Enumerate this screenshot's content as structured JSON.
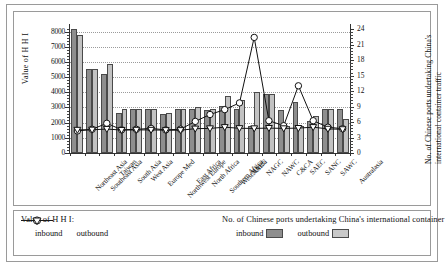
{
  "chart_data": {
    "type": "bar",
    "title": "",
    "ylabel": "Value of  H H I",
    "ylabel_right": "No. of Chinese ports undertaking China's international container traffic",
    "xlabel": "",
    "ylim": [
      0,
      8500
    ],
    "yticks": [
      0,
      1000,
      2000,
      3000,
      4000,
      5000,
      6000,
      7000,
      8000
    ],
    "ylim_right": [
      0,
      25
    ],
    "yticks_right": [
      0,
      3,
      6,
      9,
      12,
      15,
      18,
      21,
      24
    ],
    "grid": true,
    "legend_position": "bottom",
    "categories": [
      "Northeast Asia",
      "Southeast Asia",
      "Taiwan",
      "South Asia",
      "West Asia",
      "Europe Med",
      "Northwest Europe",
      "East Africa",
      "North Africa",
      "Southern Africa",
      "West Africa",
      "NAEC",
      "NAGC",
      "NAWC",
      "C&CA",
      "SAEC",
      "SANC",
      "SAWC",
      "Australasia"
    ],
    "series": [
      {
        "name": "inbound",
        "kind": "bar",
        "axis": "right",
        "values": [
          24.0,
          16.3,
          15.4,
          7.7,
          8.6,
          8.6,
          7.6,
          8.6,
          8.6,
          8.3,
          9.2,
          8.6,
          5.2,
          11.5,
          8.3,
          9.8,
          6.3,
          8.6,
          8.6
        ]
      },
      {
        "name": "outbound",
        "kind": "bar",
        "axis": "right",
        "values": [
          22.9,
          16.3,
          17.2,
          8.6,
          8.6,
          8.6,
          7.7,
          8.6,
          8.9,
          8.6,
          11.0,
          10.3,
          11.8,
          11.5,
          5.2,
          5.2,
          7.2,
          8.6,
          6.6
        ]
      },
      {
        "name": "inbound",
        "kind": "line",
        "axis": "left",
        "marker": "circle",
        "values": [
          1450,
          1560,
          1960,
          1530,
          1560,
          1620,
          1520,
          1570,
          2080,
          2540,
          2860,
          3300,
          7620,
          2130,
          1800,
          4430,
          2130,
          1700,
          1600
        ]
      },
      {
        "name": "outbound",
        "kind": "line",
        "axis": "left",
        "marker": "triangle-down",
        "values": [
          1520,
          1530,
          1580,
          1510,
          1520,
          1520,
          1500,
          1500,
          1600,
          1620,
          1700,
          1630,
          1620,
          1640,
          1620,
          1640,
          1700,
          1590,
          1560
        ]
      }
    ]
  },
  "legend": {
    "left_title": "Value of  H H I:",
    "left_inbound": "inbound",
    "left_outbound": "outbound",
    "right_title": "No. of Chinese ports undertaking China's international container traffic:",
    "right_inbound": "inbound",
    "right_outbound": "outbound"
  }
}
